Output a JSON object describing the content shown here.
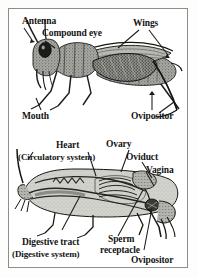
{
  "figure": {
    "background_color": "#ffffff",
    "border_color": "#8d8d8d",
    "text_color": "#141414"
  },
  "panels": [
    {
      "name": "external-anatomy",
      "subject": "grasshopper-lateral-view",
      "labels": [
        {
          "id": "antenna",
          "text": "Antenna"
        },
        {
          "id": "compound-eye",
          "text": "Compound eye"
        },
        {
          "id": "wings",
          "text": "Wings"
        },
        {
          "id": "mouth",
          "text": "Mouth"
        },
        {
          "id": "ovipositor",
          "text": "Ovipositor"
        }
      ]
    },
    {
      "name": "internal-anatomy",
      "subject": "grasshopper-dissected-view",
      "labels": [
        {
          "id": "heart",
          "text": "Heart"
        },
        {
          "id": "circulatory-system",
          "text": "(Circulatory system)"
        },
        {
          "id": "ovary",
          "text": "Ovary"
        },
        {
          "id": "oviduct",
          "text": "Oviduct"
        },
        {
          "id": "vagina",
          "text": "Vagina"
        },
        {
          "id": "sperm",
          "text": "Sperm"
        },
        {
          "id": "receptacle",
          "text": "receptacle"
        },
        {
          "id": "digestive-tract",
          "text": "Digestive tract"
        },
        {
          "id": "digestive-system",
          "text": "(Digestive system)"
        },
        {
          "id": "ovipositor-lower",
          "text": "Ovipositor"
        }
      ]
    }
  ]
}
